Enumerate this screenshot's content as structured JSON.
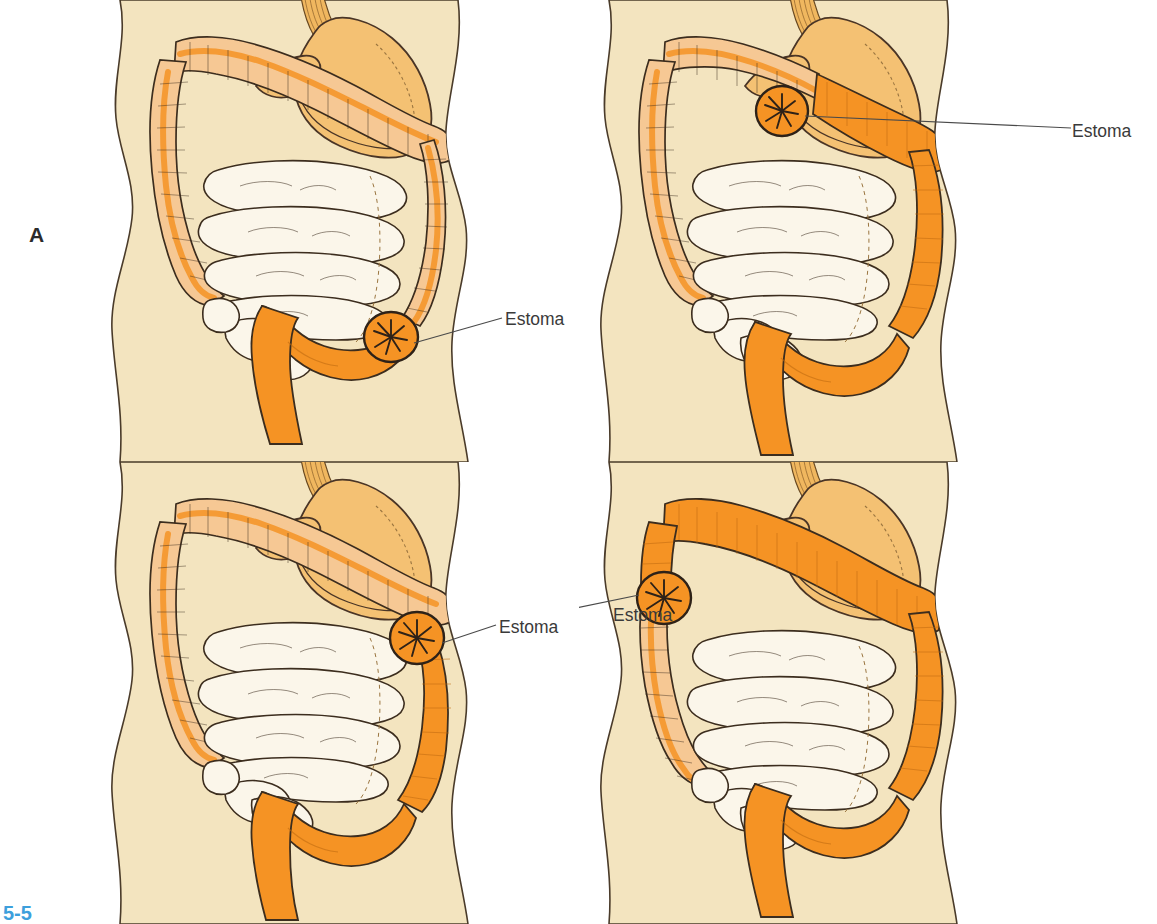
{
  "figure": {
    "number": "5-5",
    "number_color": "#3d9fdc",
    "background_color": "#ffffff"
  },
  "colors": {
    "skin": "#f3e4bf",
    "skin_outline": "#4a3b2a",
    "stomach": "#f4c173",
    "stomach_outline": "#4a3526",
    "colon_light": "#f6c894",
    "colon_bright": "#f59324",
    "colon_mid": "#f5a83f",
    "small_intestine": "#fbf6ea",
    "outline_dark": "#3c2d1e",
    "label_text": "#3a3a3a",
    "letter_text": "#2b2b2b",
    "leader_line": "#4a4a4a"
  },
  "panels": [
    {
      "id": "panel-a",
      "letter": "A",
      "letter_position": "left",
      "stoma_label": "Estoma",
      "stoma_side": "right",
      "stoma_location": "sigmoid-colon-lower-right",
      "description": "Sigmoid colostomy",
      "colored_segments": [
        "sigmoid",
        "rectum"
      ]
    },
    {
      "id": "panel-b",
      "letter": "B",
      "letter_position": "left",
      "stoma_label": "Estoma",
      "stoma_side": "right",
      "stoma_location": "descending-colon-mid-right",
      "description": "Descending colostomy",
      "colored_segments": [
        "descending",
        "sigmoid",
        "rectum"
      ]
    },
    {
      "id": "panel-c",
      "letter": "C",
      "letter_position": "right",
      "stoma_label": "Estoma",
      "stoma_side": "right",
      "stoma_location": "transverse-colon-upper-mid",
      "description": "Transverse colostomy",
      "colored_segments": [
        "transverse-right",
        "descending",
        "sigmoid",
        "rectum"
      ]
    },
    {
      "id": "panel-d",
      "letter": "D",
      "letter_position": "right",
      "stoma_label": "Estoma",
      "stoma_side": "left",
      "stoma_location": "ascending-colon-upper-left",
      "description": "Ascending colostomy",
      "colored_segments": [
        "ascending-top",
        "transverse",
        "descending",
        "sigmoid",
        "rectum"
      ]
    }
  ]
}
